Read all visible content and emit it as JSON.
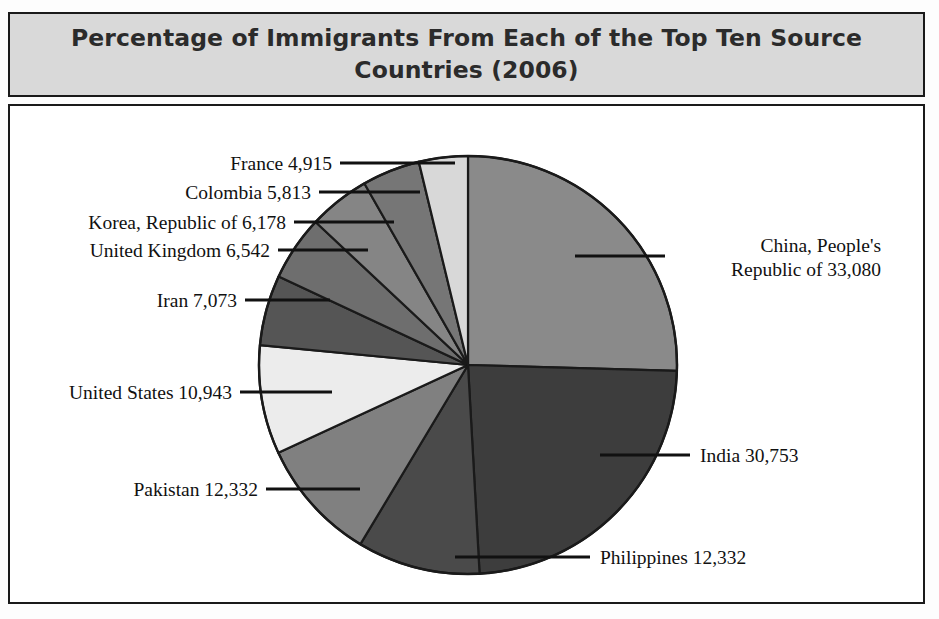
{
  "figure": {
    "title": "Percentage of Immigrants From Each of the Top Ten Source Countries (2006)",
    "title_line1": "Percentage of Immigrants From Each of the Top Ten Source",
    "title_line2": "Countries (2006)",
    "title_background": "#d9d9d9",
    "border_color": "#1a1a1a",
    "plot_background": "#ffffff"
  },
  "labels": {
    "france": "France 4,915",
    "colombia": "Colombia 5,813",
    "korea": "Korea, Republic of 6,178",
    "united_kingdom": "United Kingdom 6,542",
    "iran": "Iran 7,073",
    "united_states": "United States 10,943",
    "pakistan": "Pakistan 12,332",
    "philippines": "Philippines 12,332",
    "india": "India 30,753",
    "china_line1": "China, People's",
    "china_line2": "Republic of 33,080"
  },
  "chart_data": {
    "type": "pie",
    "title": "Percentage of Immigrants From Each of the Top Ten Source Countries (2006)",
    "subtitle": "",
    "xlabel": "",
    "ylabel": "",
    "grid": false,
    "legend": "none",
    "label_position": "outside-with-leader-lines",
    "start_angle_deg": 0,
    "direction": "clockwise",
    "total": 130961,
    "units": "immigrants",
    "year": 2006,
    "categories": [
      "China, People's Republic of",
      "India",
      "Philippines",
      "Pakistan",
      "United States",
      "Iran",
      "United Kingdom",
      "Korea, Republic of",
      "Colombia",
      "France"
    ],
    "values": [
      33080,
      30753,
      12332,
      12332,
      10943,
      7073,
      6542,
      6178,
      5813,
      4915
    ],
    "value_labels": [
      "33,080",
      "30,753",
      "12,332",
      "12,332",
      "10,943",
      "7,073",
      "6,542",
      "6,178",
      "5,813",
      "4,915"
    ],
    "percentages": [
      25.3,
      23.5,
      9.4,
      9.4,
      8.4,
      5.4,
      5.0,
      4.7,
      4.4,
      3.8
    ],
    "slice_colors": [
      "#8a8a8a",
      "#3d3d3d",
      "#4a4a4a",
      "#808080",
      "#ececec",
      "#555555",
      "#6e6e6e",
      "#858585",
      "#767676",
      "#d8d8d8"
    ],
    "slice_edge_color": "#1a1a1a",
    "slices": [
      {
        "name": "China, People's Republic of",
        "value": 33080,
        "value_label": "33,080",
        "percent": 25.3,
        "color": "#8a8a8a"
      },
      {
        "name": "India",
        "value": 30753,
        "value_label": "30,753",
        "percent": 23.5,
        "color": "#3d3d3d"
      },
      {
        "name": "Philippines",
        "value": 12332,
        "value_label": "12,332",
        "percent": 9.4,
        "color": "#4a4a4a"
      },
      {
        "name": "Pakistan",
        "value": 12332,
        "value_label": "12,332",
        "percent": 9.4,
        "color": "#808080"
      },
      {
        "name": "United States",
        "value": 10943,
        "value_label": "10,943",
        "percent": 8.4,
        "color": "#ececec"
      },
      {
        "name": "Iran",
        "value": 7073,
        "value_label": "7,073",
        "percent": 5.4,
        "color": "#555555"
      },
      {
        "name": "United Kingdom",
        "value": 6542,
        "value_label": "6,542",
        "percent": 5.0,
        "color": "#6e6e6e"
      },
      {
        "name": "Korea, Republic of",
        "value": 6178,
        "value_label": "6,178",
        "percent": 4.7,
        "color": "#858585"
      },
      {
        "name": "Colombia",
        "value": 5813,
        "value_label": "5,813",
        "percent": 4.4,
        "color": "#767676"
      },
      {
        "name": "France",
        "value": 4915,
        "value_label": "4,915",
        "percent": 3.8,
        "color": "#d8d8d8"
      }
    ]
  }
}
